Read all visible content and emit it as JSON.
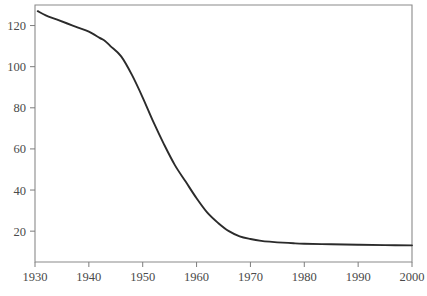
{
  "chart_data": {
    "type": "line",
    "title": "",
    "subtitle": "",
    "xlabel": "",
    "ylabel": "",
    "xlim": [
      1930,
      2000
    ],
    "ylim": [
      5,
      130
    ],
    "grid": false,
    "legend": null,
    "annotations": [],
    "xticks": [
      1930,
      1940,
      1950,
      1960,
      1970,
      1980,
      1990,
      2000
    ],
    "xtick_labels": [
      "1930",
      "1940",
      "1950",
      "1960",
      "1970",
      "1980",
      "1990",
      "2000"
    ],
    "yticks": [
      20,
      40,
      60,
      80,
      100,
      120
    ],
    "ytick_labels": [
      "20",
      "40",
      "60",
      "80",
      "100",
      "120"
    ],
    "series": [
      {
        "name": "rate",
        "color": "#2b2b2b",
        "x": [
          1930.5,
          1932,
          1934,
          1936,
          1938,
          1940,
          1942,
          1943,
          1944,
          1946,
          1948,
          1950,
          1952,
          1954,
          1956,
          1958,
          1960,
          1962,
          1964,
          1966,
          1968,
          1970,
          1972,
          1974,
          1976,
          1978,
          1980,
          1985,
          1990,
          1995,
          2000
        ],
        "values": [
          127,
          125,
          123,
          121,
          119,
          117,
          114,
          112.5,
          110,
          105,
          96,
          85,
          73,
          62,
          52,
          44,
          36,
          29,
          24,
          20,
          17.5,
          16.2,
          15.3,
          14.8,
          14.4,
          14.1,
          13.9,
          13.6,
          13.4,
          13.2,
          13.1
        ]
      }
    ]
  },
  "axes_pixels": {
    "left": 35,
    "right": 412,
    "top": 5,
    "bottom": 262
  },
  "colors": {
    "curve": "#2b2b2b",
    "frame": "#8a8a8a",
    "text": "#4a4a4a",
    "background": "#ffffff"
  }
}
